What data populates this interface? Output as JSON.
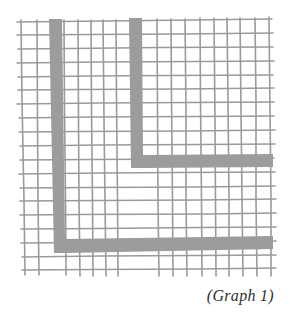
{
  "figure": {
    "caption": "(Graph 1)",
    "colors": {
      "background": "#ffffff",
      "grid_line": "#9a9a9a",
      "path_fill": "#9c9c9c",
      "caption_text": "#2e2e2e"
    },
    "grid": {
      "description": "hand-drawn square grid paper",
      "columns": 18,
      "rows": 18
    },
    "paths": [
      {
        "name": "outer-L-path",
        "shape": "L",
        "description": "thick gray band running down the left side then right along the bottom"
      },
      {
        "name": "inner-L-path",
        "shape": "L",
        "description": "thick gray band running down the middle then right to the edge"
      }
    ]
  }
}
